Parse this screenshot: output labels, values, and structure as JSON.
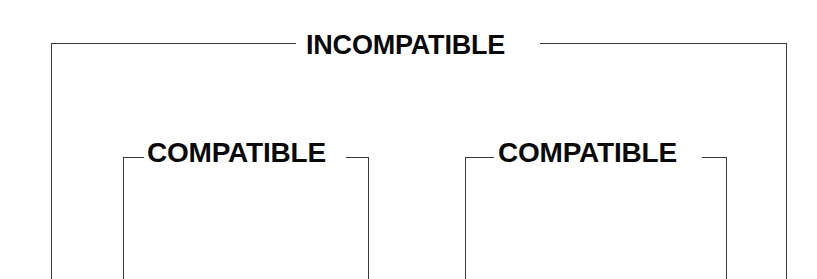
{
  "diagram": {
    "outer_box": {
      "label": "INCOMPATIBLE"
    },
    "inner_boxes": [
      {
        "label": "COMPATIBLE"
      },
      {
        "label": "COMPATIBLE"
      }
    ],
    "line_color": "#3a3a3a",
    "text_color": "#0a0a0a",
    "background": "#ffffff"
  }
}
